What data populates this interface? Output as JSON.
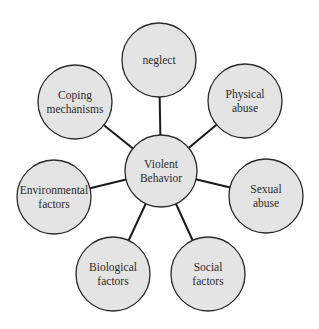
{
  "diagram": {
    "type": "hub-and-spoke",
    "colors": {
      "node_fill": "#e4e4e4",
      "node_stroke": "#2a2a2a",
      "line": "#1a1a1a",
      "text": "#2b2b2b"
    },
    "center": {
      "id": "violent-behavior",
      "lines": [
        "Violent",
        "Behavior"
      ],
      "cx": 161,
      "cy": 171,
      "r": 36
    },
    "nodes": [
      {
        "id": "neglect",
        "lines": [
          "neglect"
        ],
        "cx": 159,
        "cy": 60,
        "r": 37
      },
      {
        "id": "physical-abuse",
        "lines": [
          "Physical",
          "abuse"
        ],
        "cx": 245,
        "cy": 101,
        "r": 37
      },
      {
        "id": "sexual-abuse",
        "lines": [
          "Sexual",
          "abuse"
        ],
        "cx": 266,
        "cy": 196,
        "r": 37
      },
      {
        "id": "social-factors",
        "lines": [
          "Social",
          "factors"
        ],
        "cx": 208,
        "cy": 274,
        "r": 37
      },
      {
        "id": "biological-factors",
        "lines": [
          "Biological",
          "factors"
        ],
        "cx": 113,
        "cy": 274,
        "r": 37
      },
      {
        "id": "environmental-factors",
        "lines": [
          "Environmental",
          "factors"
        ],
        "cx": 54,
        "cy": 197,
        "r": 37
      },
      {
        "id": "coping-mechanisms",
        "lines": [
          "Coping",
          "mechanisms"
        ],
        "cx": 75,
        "cy": 102,
        "r": 37
      }
    ]
  }
}
